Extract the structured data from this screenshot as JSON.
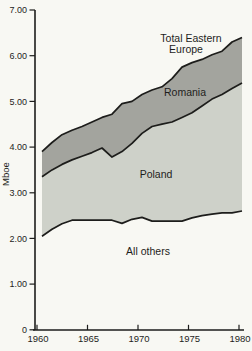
{
  "figure": {
    "background": "#f8f8f3",
    "colors": {
      "poland_area": "#ced1c9",
      "romania_area": "#a3a49e",
      "line": "#1d1d1b",
      "text": "#1e1e1c"
    },
    "y_axis": {
      "title": "Mboe",
      "tick_labels": [
        "7.00",
        "6.00",
        "5.00",
        "4.00",
        "3.00",
        "2.00",
        "1.00",
        "0"
      ],
      "tick_values": [
        7,
        6,
        5,
        4,
        3,
        2,
        1,
        0
      ]
    },
    "x_axis": {
      "tick_labels": [
        "1960",
        "1965",
        "1970",
        "1975",
        "1980"
      ],
      "tick_values": [
        1960,
        1965,
        1970,
        1975,
        1980
      ]
    },
    "annotations": {
      "total_line1": "Total Eastern",
      "total_line2": "Europe",
      "romania": "Romania",
      "poland": "Poland",
      "all_others": "All others"
    }
  },
  "chart_data": {
    "type": "area",
    "stacked": true,
    "title": "",
    "xlabel": "",
    "ylabel": "Mboe",
    "ylim": [
      0,
      7
    ],
    "xlim": [
      1960,
      1980
    ],
    "grid": false,
    "legend": "inline-labels",
    "note": "Series values are cumulative stack boundaries in Mboe read from the chart; Poland region = poland_boundary - all_others_boundary; Romania region = total_boundary - poland_boundary.",
    "x": [
      1960,
      1961,
      1962,
      1963,
      1964,
      1965,
      1966,
      1967,
      1968,
      1969,
      1970,
      1971,
      1972,
      1973,
      1974,
      1975,
      1976,
      1977,
      1978,
      1979,
      1980
    ],
    "series": [
      {
        "name": "All others",
        "boundary": [
          2.05,
          2.2,
          2.32,
          2.4,
          2.4,
          2.4,
          2.4,
          2.4,
          2.33,
          2.42,
          2.46,
          2.38,
          2.38,
          2.38,
          2.38,
          2.45,
          2.5,
          2.53,
          2.56,
          2.56,
          2.6
        ]
      },
      {
        "name": "Poland",
        "boundary": [
          3.35,
          3.5,
          3.62,
          3.72,
          3.8,
          3.88,
          3.98,
          3.78,
          3.9,
          4.08,
          4.3,
          4.45,
          4.5,
          4.55,
          4.65,
          4.75,
          4.9,
          5.05,
          5.15,
          5.28,
          5.4
        ]
      },
      {
        "name": "Total Eastern Europe",
        "boundary": [
          3.9,
          4.1,
          4.27,
          4.37,
          4.45,
          4.55,
          4.65,
          4.72,
          4.95,
          5.0,
          5.15,
          5.25,
          5.32,
          5.5,
          5.75,
          5.85,
          5.92,
          6.02,
          6.1,
          6.3,
          6.4
        ]
      }
    ]
  }
}
